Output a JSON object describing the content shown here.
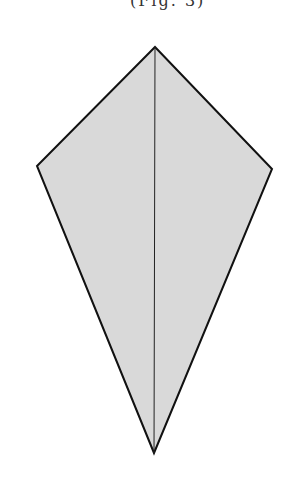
{
  "caption": {
    "text": "(Fig. 3)"
  },
  "figure": {
    "shape": "kite",
    "fill_color": "#d9d9d9",
    "stroke_color": "#111111",
    "vertices": {
      "top": [
        155,
        47
      ],
      "left": [
        37,
        166
      ],
      "right": [
        272,
        169
      ],
      "bottom": [
        154,
        453
      ]
    },
    "center_line": {
      "from": [
        155,
        47
      ],
      "to": [
        154,
        453
      ]
    }
  }
}
